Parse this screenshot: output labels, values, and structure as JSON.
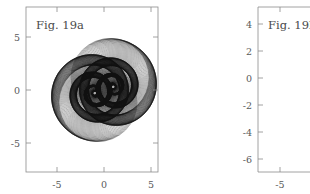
{
  "figure": {
    "background_color": "#ffffff",
    "axis_color": "#8c8c8c",
    "curve_color": "#101010",
    "text_color": "#5a5a5a"
  },
  "panels": [
    {
      "id": "a",
      "title": "Fig. 19a",
      "x_ticks": [
        "-5",
        "0",
        "5"
      ],
      "y_ticks": [
        "5",
        "0",
        "-5"
      ]
    },
    {
      "id": "b",
      "title": "Fig. 19b",
      "x_ticks": [
        "-5"
      ],
      "y_ticks": [
        "4",
        "2",
        "0",
        "-2",
        "-4",
        "-6"
      ]
    }
  ],
  "chart_data": [
    {
      "type": "line",
      "title": "Fig. 19a",
      "xlabel": "",
      "ylabel": "",
      "xlim": [
        -8.2,
        8.2
      ],
      "ylim": [
        -8.2,
        8.2
      ],
      "xticks": [
        -5,
        0,
        5
      ],
      "yticks": [
        -5,
        0,
        5
      ],
      "grid": false,
      "legend": "none",
      "description": "Envelope family of 240 circles whose centers traverse a lemniscate-like double loop, producing two interlocking logarithmic-spiral lobes (yin-yang / double-spiral moire pattern) with black filled regions and white inner discs.",
      "series": [
        {
          "name": "circle-family",
          "count": 240,
          "generator": "spiral-lemniscate",
          "params": {
            "turns": 3.25,
            "growth": 1.0105,
            "base_radius": 0.22,
            "max_radius": 4.15,
            "lobe_separation": 2.05,
            "rotation_deg": 18
          }
        }
      ]
    },
    {
      "type": "line",
      "title": "Fig. 19b",
      "xlabel": "",
      "ylabel": "",
      "xlim": [
        -7.5,
        7.5
      ],
      "ylim": [
        -6.8,
        5.2
      ],
      "xticks": [
        -5
      ],
      "yticks": [
        -6,
        -4,
        -2,
        0,
        2,
        4
      ],
      "grid": false,
      "legend": "none",
      "description": "Family of ~55 nested, progressively offset circles of slowly growing radius forming a single eccentric spiral-packed disc; curves drawn in light grey.",
      "series": [
        {
          "name": "circle-family",
          "count": 55,
          "generator": "offset-nested-circles",
          "params": {
            "center_x": -0.4,
            "center_y": -1.35,
            "radius_start": 0.35,
            "radius_end": 4.6,
            "drift_x": 0.055,
            "drift_y": -0.03
          }
        }
      ]
    }
  ]
}
